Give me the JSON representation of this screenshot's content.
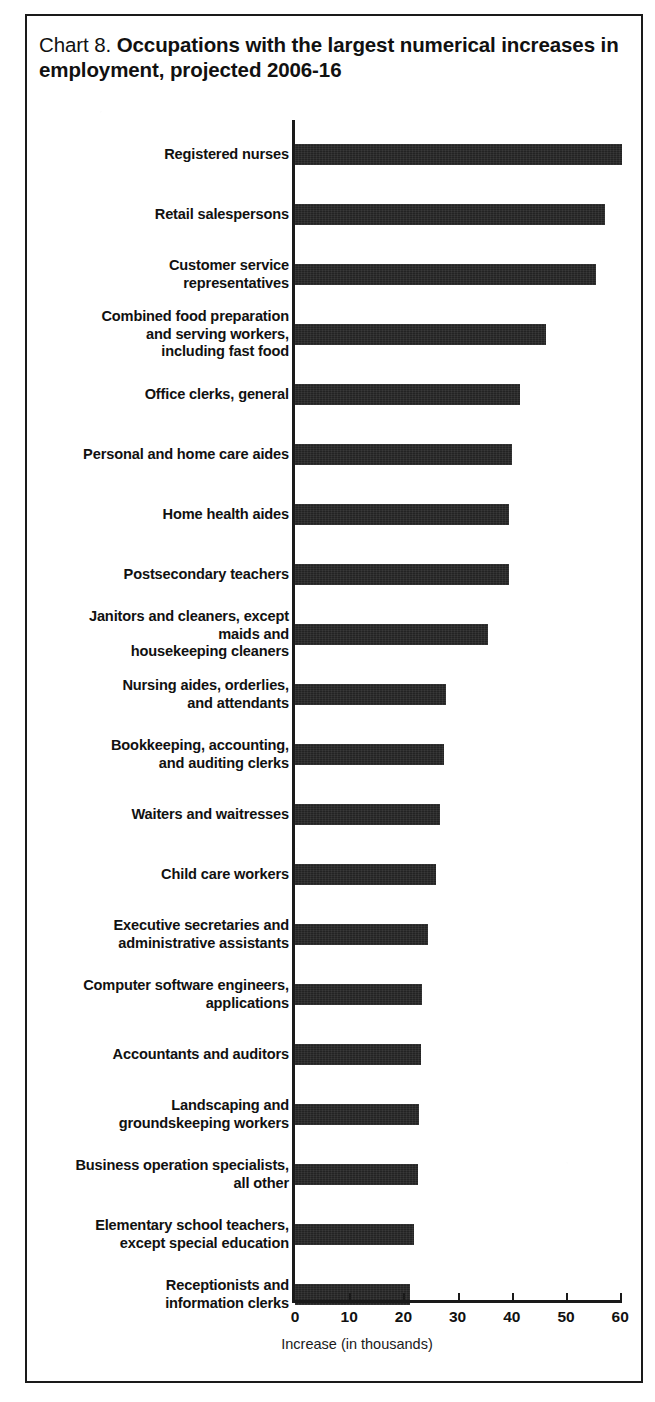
{
  "figure": {
    "title_prefix": "Chart 8. ",
    "title_main": "Occupations with the largest numerical increases in employment, projected 2006-16"
  },
  "chart_data": {
    "type": "bar",
    "orientation": "horizontal",
    "title": "Chart 8. Occupations with the largest numerical increases in employment, projected 2006-16",
    "xlabel": "Increase (in thousands)",
    "ylabel": "",
    "xlim": [
      0,
      60
    ],
    "xticks": [
      "0",
      "10",
      "20",
      "30",
      "40",
      "50",
      "60"
    ],
    "xtick_values": [
      0,
      10,
      20,
      30,
      40,
      50,
      60
    ],
    "grid": false,
    "legend": null,
    "bar_color": "#232323",
    "categories": [
      "Registered nurses",
      "Retail salespersons",
      "Customer service representatives",
      "Combined food preparation and serving workers, including fast food",
      "Office clerks, general",
      "Personal and home care aides",
      "Home health aides",
      "Postsecondary teachers",
      "Janitors and cleaners, except maids and housekeeping cleaners",
      "Nursing aides, orderlies, and attendants",
      "Bookkeeping, accounting, and auditing clerks",
      "Waiters and waitresses",
      "Child care workers",
      "Executive secretaries and administrative assistants",
      "Computer software engineers, applications",
      "Accountants and auditors",
      "Landscaping and groundskeeping workers",
      "Business operation specialists, all other",
      "Elementary school teachers, except special education",
      "Receptionists and information clerks"
    ],
    "values": [
      60.3,
      57.2,
      55.6,
      46.3,
      41.5,
      40.1,
      39.5,
      39.4,
      35.7,
      27.9,
      27.5,
      26.8,
      26.0,
      24.5,
      23.4,
      23.2,
      22.9,
      22.7,
      21.9,
      21.2
    ]
  },
  "bars": [
    {
      "label_lines": [
        "Registered nurses"
      ],
      "value": 60.3
    },
    {
      "label_lines": [
        "Retail salespersons"
      ],
      "value": 57.2
    },
    {
      "label_lines": [
        "Customer service",
        "representatives"
      ],
      "value": 55.6
    },
    {
      "label_lines": [
        "Combined food preparation",
        "and serving workers,",
        "including fast food"
      ],
      "value": 46.3
    },
    {
      "label_lines": [
        "Office clerks, general"
      ],
      "value": 41.5
    },
    {
      "label_lines": [
        "Personal and home care aides"
      ],
      "value": 40.1
    },
    {
      "label_lines": [
        "Home health aides"
      ],
      "value": 39.5
    },
    {
      "label_lines": [
        "Postsecondary teachers"
      ],
      "value": 39.4
    },
    {
      "label_lines": [
        "Janitors and cleaners, except",
        "maids and",
        "housekeeping cleaners"
      ],
      "value": 35.7
    },
    {
      "label_lines": [
        "Nursing aides, orderlies,",
        "and attendants"
      ],
      "value": 27.9
    },
    {
      "label_lines": [
        "Bookkeeping, accounting,",
        "and auditing clerks"
      ],
      "value": 27.5
    },
    {
      "label_lines": [
        "Waiters and waitresses"
      ],
      "value": 26.8
    },
    {
      "label_lines": [
        "Child care workers"
      ],
      "value": 26.0
    },
    {
      "label_lines": [
        "Executive secretaries and",
        "administrative assistants"
      ],
      "value": 24.5
    },
    {
      "label_lines": [
        "Computer software engineers,",
        "applications"
      ],
      "value": 23.4
    },
    {
      "label_lines": [
        "Accountants and auditors"
      ],
      "value": 23.2
    },
    {
      "label_lines": [
        "Landscaping and",
        "groundskeeping workers"
      ],
      "value": 22.9
    },
    {
      "label_lines": [
        "Business operation specialists,",
        "all other"
      ],
      "value": 22.7
    },
    {
      "label_lines": [
        "Elementary school teachers,",
        "except special education"
      ],
      "value": 21.9
    },
    {
      "label_lines": [
        "Receptionists and",
        "information clerks"
      ],
      "value": 21.2
    }
  ]
}
